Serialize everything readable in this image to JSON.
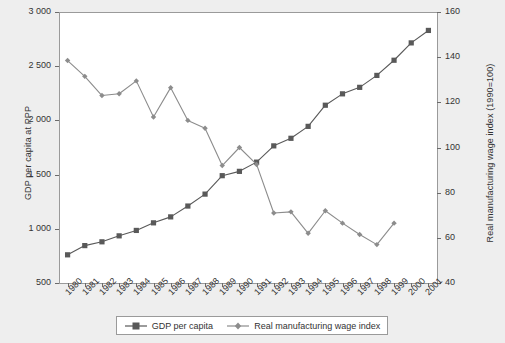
{
  "chart_data": {
    "type": "line",
    "title": "",
    "subtitle": "",
    "xlabel": "",
    "ylabel": "GDP per capita at PPP",
    "ylabel_right": "Real manufacturing wage index (1990=100)",
    "grid": false,
    "legend_position": "bottom",
    "categories": [
      "1980",
      "1981",
      "1982",
      "1983",
      "1984",
      "1985",
      "1986",
      "1987",
      "1988",
      "1989",
      "1990",
      "1991",
      "1992",
      "1993",
      "1994",
      "1995",
      "1996",
      "1997",
      "1998",
      "1999",
      "2000",
      "2001"
    ],
    "ylim": [
      500,
      3000
    ],
    "yticks": [
      "500",
      "1 000",
      "1 500",
      "2 000",
      "2 500",
      "3 000"
    ],
    "ytick_values": [
      500,
      1000,
      1500,
      2000,
      2500,
      3000
    ],
    "ylim_right": [
      40,
      160
    ],
    "yticks_right": [
      "40",
      "60",
      "80",
      "100",
      "120",
      "140",
      "160"
    ],
    "ytick_values_right": [
      40,
      60,
      80,
      100,
      120,
      140,
      160
    ],
    "series": [
      {
        "name": "GDP per capita",
        "axis": "left",
        "color": "#595959",
        "marker": "square",
        "values": [
          760,
          845,
          880,
          935,
          985,
          1055,
          1110,
          1210,
          1320,
          1490,
          1530,
          1615,
          1765,
          1835,
          1945,
          2140,
          2245,
          2305,
          2415,
          2555,
          2715,
          2830
        ]
      },
      {
        "name": "Real manufacturing wage index",
        "axis": "right",
        "color": "#8c8c8c",
        "marker": "diamond",
        "values": [
          138.5,
          131.5,
          123.0,
          123.8,
          129.5,
          113.5,
          126.5,
          112.0,
          108.5,
          92.0,
          100.0,
          92.5,
          71.0,
          71.5,
          62.0,
          72.0,
          66.5,
          61.5,
          57.0,
          66.5,
          null,
          null
        ]
      }
    ]
  },
  "legend": {
    "items": [
      {
        "label": "GDP per capita",
        "marker": "square-line",
        "color": "#595959"
      },
      {
        "label": "Real manufacturing wage index",
        "marker": "diamond-line",
        "color": "#8c8c8c"
      }
    ]
  }
}
